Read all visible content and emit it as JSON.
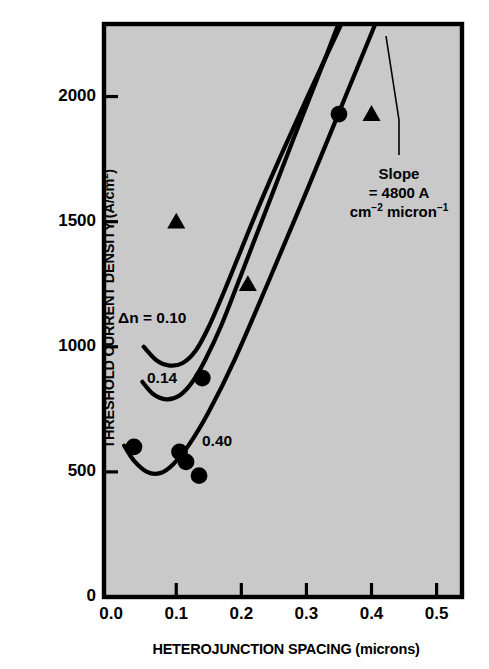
{
  "figure": {
    "background_color": "#ffffff",
    "plot_area_color": "#c9c9c9",
    "frame_color": "#000000",
    "ink_color": "#000000"
  },
  "axes": {
    "y_title": "THRESHOLD CURRENT DENSITY (A/cm",
    "y_title_sup": "2",
    "y_title_close": ")",
    "x_title": "HETEROJUNCTION SPACING (microns)",
    "y_ticks": [
      "0",
      "500",
      "1000",
      "1500",
      "2000"
    ],
    "x_ticks": [
      "0.0",
      "0.1",
      "0.2",
      "0.3",
      "0.4",
      "0.5"
    ]
  },
  "annotations": {
    "curve_labels": [
      {
        "text": "Δn = 0.10"
      },
      {
        "text": "0.14"
      },
      {
        "text": "0.40"
      }
    ],
    "slope_line1": "Slope",
    "slope_line2": "= 4800 A",
    "slope_line3a": "cm",
    "slope_line3b": "−2",
    "slope_line3c": " micron",
    "slope_line3d": "−1"
  },
  "chart_data": {
    "type": "scatter",
    "title": "",
    "xlabel": "HETEROJUNCTION SPACING (microns)",
    "ylabel": "THRESHOLD CURRENT DENSITY (A/cm^2)",
    "xlim": [
      -0.011,
      0.539
    ],
    "ylim": [
      0,
      2290
    ],
    "grid": false,
    "legend": "none",
    "xticks": [
      0.0,
      0.1,
      0.2,
      0.3,
      0.4,
      0.5
    ],
    "yticks": [
      0,
      500,
      1000,
      1500,
      2000
    ],
    "series": [
      {
        "name": "circles",
        "marker": "circle",
        "x": [
          0.035,
          0.105,
          0.115,
          0.135,
          0.14,
          0.35
        ],
        "y": [
          600,
          580,
          540,
          485,
          875,
          1930
        ]
      },
      {
        "name": "triangles",
        "marker": "triangle",
        "x": [
          0.1,
          0.21,
          0.4
        ],
        "y": [
          1500,
          1250,
          1930
        ]
      }
    ],
    "curves": [
      {
        "name": "dn = 0.10",
        "label": "Δn = 0.10",
        "x": [
          0.05,
          0.07,
          0.09,
          0.11,
          0.13,
          0.15,
          0.175,
          0.2,
          0.23,
          0.26,
          0.3,
          0.35,
          0.4,
          0.445
        ],
        "y": [
          1000,
          945,
          925,
          935,
          985,
          1080,
          1230,
          1390,
          1580,
          1760,
          1990,
          2270,
          2545,
          2790
        ]
      },
      {
        "name": "dn = 0.14",
        "label": "0.14",
        "x": [
          0.048,
          0.065,
          0.085,
          0.105,
          0.125,
          0.145,
          0.17,
          0.2,
          0.24,
          0.28,
          0.33,
          0.38,
          0.43,
          0.46
        ],
        "y": [
          860,
          810,
          790,
          805,
          860,
          950,
          1090,
          1290,
          1560,
          1830,
          2160,
          2500,
          2830,
          3030
        ]
      },
      {
        "name": "dn = 0.40",
        "label": "0.40",
        "x": [
          0.02,
          0.035,
          0.055,
          0.075,
          0.095,
          0.12,
          0.15,
          0.19,
          0.24,
          0.3,
          0.36,
          0.42,
          0.47
        ],
        "y": [
          605,
          545,
          500,
          495,
          530,
          610,
          740,
          950,
          1250,
          1620,
          2000,
          2380,
          2700
        ]
      }
    ],
    "annotations": [
      {
        "text": "Slope = 4800 A cm^-2 micron^-1",
        "x": 0.4,
        "y": 1650
      }
    ]
  }
}
